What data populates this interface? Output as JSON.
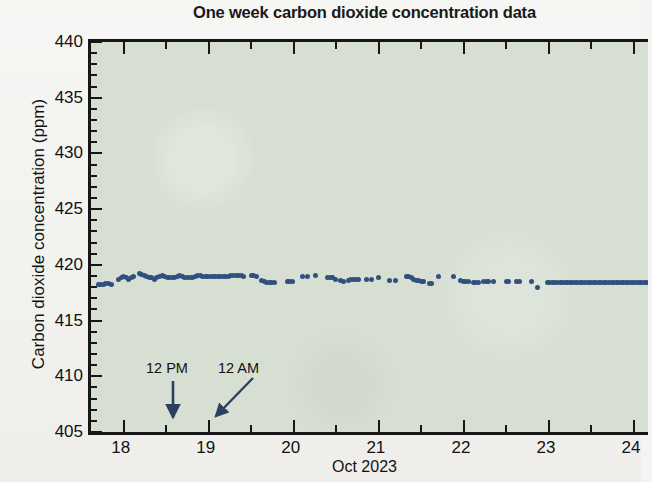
{
  "figure": {
    "title": "One week carbon dioxide concentration data",
    "background_color": "#d6dfd1",
    "point_color": "#32507f",
    "axis_color": "#161616"
  },
  "axes": {
    "x": {
      "label": "Oct 2023",
      "ticks": [
        "18",
        "19",
        "20",
        "21",
        "22",
        "23",
        "24"
      ],
      "min": 17.65,
      "max": 24.2,
      "minor_step": 0.5
    },
    "y": {
      "label": "Carbon dioxide concentration (ppm)",
      "ticks": [
        "405",
        "410",
        "415",
        "420",
        "425",
        "430",
        "435",
        "440"
      ],
      "min": 405,
      "max": 440,
      "minor_step": 1
    }
  },
  "annotations": [
    {
      "name": "noon-marker",
      "text": "12 PM",
      "x_value": 18.5,
      "arrow": "down"
    },
    {
      "name": "midnight-marker",
      "text": "12 AM",
      "x_value": 19.0,
      "arrow": "down-left"
    }
  ],
  "chart_data": {
    "type": "scatter",
    "title": "One week carbon dioxide concentration data",
    "xlabel": "Oct 2023",
    "ylabel": "Carbon dioxide concentration (ppm)",
    "xlim": [
      17.65,
      24.2
    ],
    "ylim": [
      405,
      440
    ],
    "grid": false,
    "legend": null,
    "x_tick_values": [
      18,
      19,
      20,
      21,
      22,
      23,
      24
    ],
    "y_tick_values": [
      405,
      410,
      415,
      420,
      425,
      430,
      435,
      440
    ],
    "series": [
      {
        "name": "CO2 concentration",
        "color": "#32507f",
        "marker": "circle",
        "points": [
          [
            17.7,
            418.5
          ],
          [
            17.73,
            418.5
          ],
          [
            17.76,
            418.5
          ],
          [
            17.79,
            418.6
          ],
          [
            17.82,
            418.6
          ],
          [
            17.85,
            418.5
          ],
          [
            17.94,
            419.0
          ],
          [
            17.97,
            419.1
          ],
          [
            18.0,
            419.2
          ],
          [
            18.03,
            419.1
          ],
          [
            18.06,
            419.0
          ],
          [
            18.09,
            419.1
          ],
          [
            18.12,
            419.2
          ],
          [
            18.18,
            419.5
          ],
          [
            18.21,
            419.4
          ],
          [
            18.24,
            419.3
          ],
          [
            18.27,
            419.2
          ],
          [
            18.3,
            419.1
          ],
          [
            18.33,
            419.1
          ],
          [
            18.36,
            419.0
          ],
          [
            18.39,
            419.1
          ],
          [
            18.42,
            419.2
          ],
          [
            18.45,
            419.3
          ],
          [
            18.48,
            419.2
          ],
          [
            18.51,
            419.1
          ],
          [
            18.54,
            419.1
          ],
          [
            18.57,
            419.1
          ],
          [
            18.6,
            419.1
          ],
          [
            18.63,
            419.2
          ],
          [
            18.66,
            419.3
          ],
          [
            18.69,
            419.2
          ],
          [
            18.72,
            419.1
          ],
          [
            18.75,
            419.1
          ],
          [
            18.78,
            419.1
          ],
          [
            18.81,
            419.1
          ],
          [
            18.84,
            419.2
          ],
          [
            18.87,
            419.3
          ],
          [
            18.9,
            419.3
          ],
          [
            18.93,
            419.2
          ],
          [
            18.96,
            419.2
          ],
          [
            18.99,
            419.2
          ],
          [
            19.02,
            419.2
          ],
          [
            19.05,
            419.2
          ],
          [
            19.08,
            419.2
          ],
          [
            19.11,
            419.2
          ],
          [
            19.14,
            419.2
          ],
          [
            19.17,
            419.2
          ],
          [
            19.2,
            419.2
          ],
          [
            19.23,
            419.2
          ],
          [
            19.26,
            419.3
          ],
          [
            19.29,
            419.3
          ],
          [
            19.32,
            419.3
          ],
          [
            19.35,
            419.3
          ],
          [
            19.38,
            419.3
          ],
          [
            19.41,
            419.2
          ],
          [
            19.5,
            419.3
          ],
          [
            19.53,
            419.3
          ],
          [
            19.56,
            419.2
          ],
          [
            19.62,
            418.9
          ],
          [
            19.65,
            418.8
          ],
          [
            19.68,
            418.7
          ],
          [
            19.71,
            418.7
          ],
          [
            19.74,
            418.7
          ],
          [
            19.77,
            418.7
          ],
          [
            19.92,
            418.8
          ],
          [
            19.95,
            418.8
          ],
          [
            19.98,
            418.8
          ],
          [
            20.1,
            419.2
          ],
          [
            20.16,
            419.2
          ],
          [
            20.25,
            419.3
          ],
          [
            20.4,
            419.1
          ],
          [
            20.43,
            419.1
          ],
          [
            20.46,
            419.1
          ],
          [
            20.49,
            419.0
          ],
          [
            20.55,
            418.9
          ],
          [
            20.58,
            418.8
          ],
          [
            20.64,
            418.9
          ],
          [
            20.67,
            419.0
          ],
          [
            20.7,
            419.0
          ],
          [
            20.73,
            419.0
          ],
          [
            20.76,
            419.0
          ],
          [
            20.85,
            419.0
          ],
          [
            20.91,
            419.0
          ],
          [
            21.0,
            419.1
          ],
          [
            21.12,
            418.9
          ],
          [
            21.2,
            418.9
          ],
          [
            21.32,
            419.2
          ],
          [
            21.35,
            419.2
          ],
          [
            21.38,
            419.1
          ],
          [
            21.41,
            419.0
          ],
          [
            21.44,
            418.9
          ],
          [
            21.47,
            418.9
          ],
          [
            21.5,
            418.8
          ],
          [
            21.53,
            418.8
          ],
          [
            21.59,
            418.6
          ],
          [
            21.62,
            418.6
          ],
          [
            21.7,
            419.2
          ],
          [
            21.88,
            419.2
          ],
          [
            21.96,
            418.9
          ],
          [
            21.99,
            418.8
          ],
          [
            22.02,
            418.8
          ],
          [
            22.05,
            418.8
          ],
          [
            22.11,
            418.7
          ],
          [
            22.14,
            418.7
          ],
          [
            22.17,
            418.7
          ],
          [
            22.23,
            418.8
          ],
          [
            22.26,
            418.8
          ],
          [
            22.29,
            418.8
          ],
          [
            22.35,
            418.8
          ],
          [
            22.5,
            418.8
          ],
          [
            22.53,
            418.8
          ],
          [
            22.62,
            418.8
          ],
          [
            22.65,
            418.8
          ],
          [
            22.8,
            418.8
          ],
          [
            22.86,
            418.2
          ],
          [
            22.98,
            418.7
          ],
          [
            23.01,
            418.7
          ],
          [
            23.04,
            418.7
          ],
          [
            23.07,
            418.7
          ],
          [
            23.1,
            418.7
          ],
          [
            23.13,
            418.7
          ],
          [
            23.16,
            418.7
          ],
          [
            23.19,
            418.7
          ],
          [
            23.22,
            418.7
          ],
          [
            23.25,
            418.7
          ],
          [
            23.28,
            418.7
          ],
          [
            23.31,
            418.7
          ],
          [
            23.34,
            418.7
          ],
          [
            23.37,
            418.7
          ],
          [
            23.4,
            418.7
          ],
          [
            23.43,
            418.7
          ],
          [
            23.46,
            418.7
          ],
          [
            23.49,
            418.7
          ],
          [
            23.52,
            418.7
          ],
          [
            23.55,
            418.7
          ],
          [
            23.58,
            418.7
          ],
          [
            23.61,
            418.7
          ],
          [
            23.64,
            418.7
          ],
          [
            23.67,
            418.7
          ],
          [
            23.7,
            418.7
          ],
          [
            23.73,
            418.7
          ],
          [
            23.76,
            418.7
          ],
          [
            23.79,
            418.7
          ],
          [
            23.82,
            418.7
          ],
          [
            23.85,
            418.7
          ],
          [
            23.88,
            418.7
          ],
          [
            23.91,
            418.7
          ],
          [
            23.94,
            418.7
          ],
          [
            23.97,
            418.7
          ],
          [
            24.0,
            418.7
          ],
          [
            24.03,
            418.7
          ],
          [
            24.06,
            418.7
          ],
          [
            24.09,
            418.7
          ],
          [
            24.12,
            418.7
          ],
          [
            24.15,
            418.7
          ]
        ]
      }
    ]
  }
}
